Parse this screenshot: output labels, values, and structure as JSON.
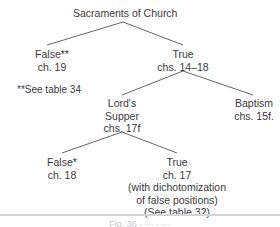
{
  "diagram": {
    "root": {
      "lines": [
        "Sacraments of Church"
      ]
    },
    "false_branch": {
      "lines": [
        "False**",
        "ch. 19"
      ]
    },
    "true_branch": {
      "lines": [
        "True",
        "chs. 14–18"
      ]
    },
    "footnote": "**See table 34",
    "lords_supper": {
      "lines": [
        "Lord's",
        "Supper",
        "chs. 17f"
      ]
    },
    "baptism": {
      "lines": [
        "Baptism",
        "chs. 15f."
      ]
    },
    "ls_false": {
      "lines": [
        "False*",
        "ch. 18"
      ]
    },
    "ls_true": {
      "lines": [
        "True",
        "ch. 17",
        "(with dichotomization",
        "of false positions)",
        "(See table 32)"
      ]
    },
    "caption": "Fig. 36  ·  ···  ·  ···",
    "line_color": "#666666"
  }
}
